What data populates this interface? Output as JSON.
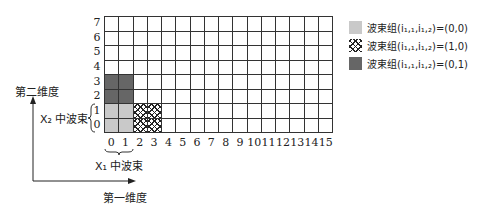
{
  "diagram": {
    "grid": {
      "columns": 16,
      "rows": 8,
      "x_ticks": [
        "0",
        "1",
        "2",
        "3",
        "4",
        "5",
        "6",
        "7",
        "8",
        "9",
        "10",
        "11",
        "12",
        "13",
        "14",
        "15"
      ],
      "y_ticks": [
        "0",
        "1",
        "2",
        "3",
        "4",
        "5",
        "6",
        "7"
      ],
      "filled_cells": [
        {
          "col": 0,
          "row": 0,
          "style": "light"
        },
        {
          "col": 1,
          "row": 0,
          "style": "light"
        },
        {
          "col": 0,
          "row": 1,
          "style": "light"
        },
        {
          "col": 1,
          "row": 1,
          "style": "light"
        },
        {
          "col": 2,
          "row": 0,
          "style": "hatch"
        },
        {
          "col": 3,
          "row": 0,
          "style": "hatch"
        },
        {
          "col": 2,
          "row": 1,
          "style": "hatch"
        },
        {
          "col": 3,
          "row": 1,
          "style": "hatch"
        },
        {
          "col": 0,
          "row": 2,
          "style": "dark"
        },
        {
          "col": 1,
          "row": 2,
          "style": "dark"
        },
        {
          "col": 0,
          "row": 3,
          "style": "dark"
        },
        {
          "col": 1,
          "row": 3,
          "style": "dark"
        }
      ]
    },
    "axis_labels": {
      "vertical": "第二维度",
      "horizontal": "第一维度"
    },
    "brace_labels": {
      "x1": "X₁ 中波束",
      "x2": "X₂ 中波束"
    },
    "legend": [
      {
        "style": "light",
        "label": "波束组(i₁,₁,i₁,₂)=(0,0)"
      },
      {
        "style": "hatch",
        "label": "波束组(i₁,₁,i₁,₂)=(1,0)"
      },
      {
        "style": "dark",
        "label": "波束组(i₁,₁,i₁,₂)=(0,1)"
      }
    ],
    "colors": {
      "light": "#c9c9c9",
      "dark": "#666666",
      "grid": "#333333"
    }
  }
}
